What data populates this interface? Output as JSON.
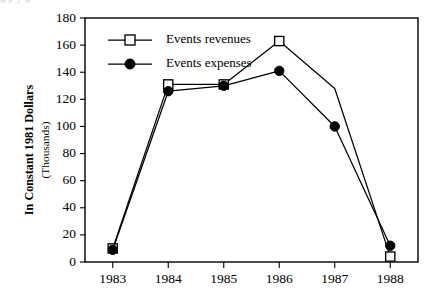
{
  "chart_data": {
    "type": "line",
    "title": "",
    "xlabel": "",
    "ylabel": "In Constant 1981 Dollars",
    "ylabel_sub": "(Thousands)",
    "categories": [
      "1983",
      "1984",
      "1985",
      "1986",
      "1987",
      "1988"
    ],
    "x": [
      1983,
      1984,
      1985,
      1986,
      1987,
      1988
    ],
    "xlim": [
      1982.5,
      1988.5
    ],
    "ylim": [
      0,
      180
    ],
    "yticks": [
      0,
      20,
      40,
      60,
      80,
      100,
      120,
      140,
      160,
      180
    ],
    "ytick_labels": [
      "0",
      "20",
      "40",
      "60",
      "80",
      "100",
      "120",
      "140",
      "160",
      "180"
    ],
    "xticks": [
      1983,
      1984,
      1985,
      1986,
      1987,
      1988
    ],
    "xtick_labels": [
      "1983",
      "1984",
      "1985",
      "1986",
      "1987",
      "1988"
    ],
    "grid": false,
    "legend_position": "top-left-inside",
    "series": [
      {
        "name": "Events revenues",
        "marker": "open-square",
        "values": [
          10,
          131,
          131,
          163,
          128,
          4
        ],
        "marker_visible": [
          true,
          true,
          true,
          true,
          false,
          true
        ]
      },
      {
        "name": "Events expenses",
        "marker": "filled-circle",
        "values": [
          9,
          126,
          130,
          141,
          100,
          12
        ],
        "marker_visible": [
          true,
          true,
          true,
          true,
          true,
          true
        ]
      }
    ],
    "colors": {
      "axis": "#000000",
      "revenues_line": "#000000",
      "revenues_fill": "#ffffff",
      "expenses_line": "#000000",
      "expenses_fill": "#000000",
      "background": "#ffffff"
    }
  },
  "legend": {
    "entries": [
      {
        "label": "Events revenues",
        "marker": "open-square"
      },
      {
        "label": "Events expenses",
        "marker": "filled-circle"
      }
    ]
  },
  "artifacts": {
    "top_strip_text": "g      p            y          g"
  }
}
